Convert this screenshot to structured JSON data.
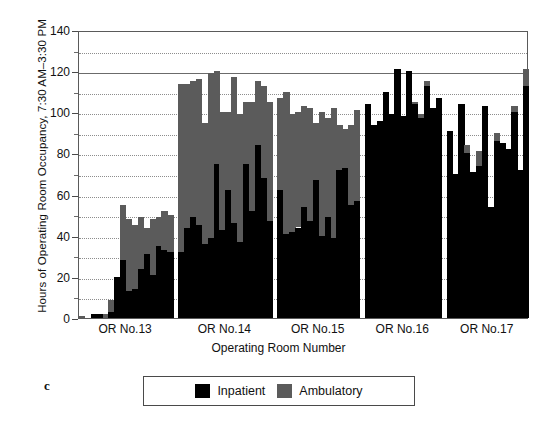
{
  "figure": {
    "panel_letter": "c"
  },
  "chart_data": {
    "type": "bar",
    "stacked": true,
    "title": "",
    "xlabel": "Operating Room Number",
    "ylabel": "Hours of Operating Room Occupancy, 7:30 AM–3:30 PM",
    "ylim": [
      0,
      140
    ],
    "yticks": [
      0,
      20,
      40,
      60,
      80,
      100,
      120,
      140
    ],
    "yticks_minor": [
      10,
      30,
      50,
      70,
      90,
      110,
      130
    ],
    "grid": "horizontal-dotted",
    "legend_position": "below-axes",
    "series": [
      {
        "name": "Inpatient",
        "color": "#000000"
      },
      {
        "name": "Ambulatory",
        "color": "#5b5b5b"
      }
    ],
    "groups": [
      {
        "label": "OR No.13",
        "inpatient": [
          0,
          0,
          2,
          2,
          0,
          3,
          20,
          28,
          13,
          14,
          24,
          31,
          21,
          35,
          33,
          32
        ],
        "ambulatory": [
          1,
          0,
          0,
          0,
          2,
          6,
          0,
          27,
          35,
          31,
          25,
          13,
          27,
          14,
          19,
          18
        ]
      },
      {
        "label": "OR No.14",
        "inpatient": [
          32,
          44,
          49,
          45,
          36,
          39,
          75,
          43,
          62,
          46,
          37,
          75,
          52,
          84,
          68,
          47
        ],
        "ambulatory": [
          82,
          70,
          66,
          71,
          59,
          80,
          45,
          57,
          38,
          71,
          62,
          30,
          53,
          31,
          45,
          58
        ]
      },
      {
        "label": "OR No.15",
        "inpatient": [
          62,
          41,
          42,
          44,
          54,
          47,
          67,
          40,
          49,
          39,
          72,
          73,
          55,
          57
        ],
        "ambulatory": [
          45,
          69,
          57,
          56,
          49,
          55,
          28,
          60,
          48,
          63,
          22,
          19,
          39,
          44
        ]
      },
      {
        "label": "OR No.16",
        "inpatient": [
          104,
          94,
          96,
          110,
          99,
          121,
          98,
          120,
          104,
          97,
          113,
          102,
          107
        ],
        "ambulatory": [
          0,
          0,
          0,
          0,
          0,
          0,
          0,
          0,
          1,
          2,
          2,
          0,
          0
        ]
      },
      {
        "label": "OR No.17",
        "inpatient": [
          91,
          70,
          104,
          80,
          71,
          74,
          103,
          54,
          86,
          85,
          82,
          100,
          72,
          113
        ],
        "ambulatory": [
          0,
          0,
          0,
          4,
          0,
          7,
          0,
          0,
          4,
          0,
          0,
          3,
          0,
          8
        ]
      }
    ]
  }
}
